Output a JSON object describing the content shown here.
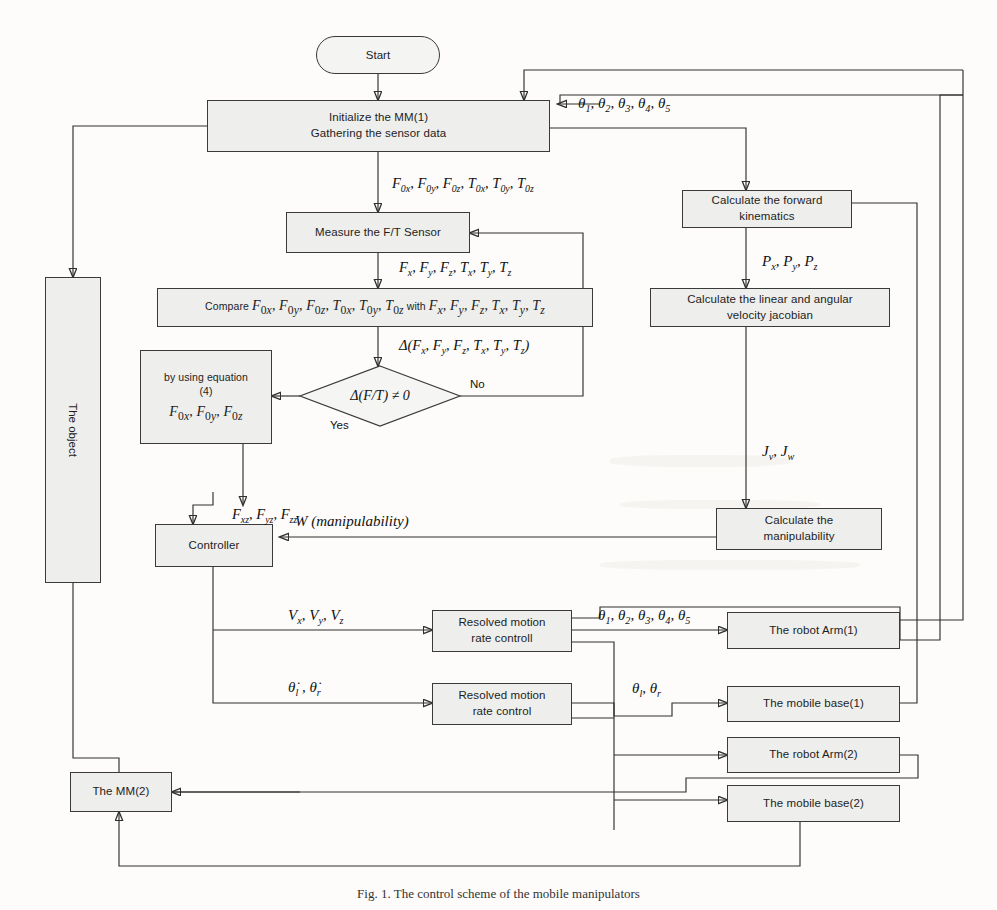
{
  "figure": {
    "caption": "Fig. 1. The control scheme of the mobile manipulators"
  },
  "nodes": {
    "start": {
      "label": "Start",
      "shape": "terminator"
    },
    "initialize": {
      "label": "Initialize the MM(1)\nGathering the sensor data",
      "line1": "Initialize the MM(1)",
      "line2": "Gathering the sensor data",
      "shape": "process"
    },
    "measure_ft": {
      "label": "Measure the F/T Sensor",
      "shape": "process"
    },
    "compare": {
      "label": "Compare F0x , F0y , F0z , T0x , T0y , T0z with  Fx , Fy , Fz , Tx , Ty , Tz",
      "shape": "process"
    },
    "decision": {
      "label": "Δ(F / T) ≠ 0",
      "shape": "decision",
      "yes_label": "Yes",
      "no_label": "No"
    },
    "equation": {
      "line1": "by using equation",
      "line2": "(4)",
      "line3": "F0x , F0y , F0z",
      "shape": "process"
    },
    "controller": {
      "label": "Controller",
      "shape": "process"
    },
    "forward_kinematics": {
      "line1": "Calculate the forward",
      "line2": "kinematics",
      "shape": "process"
    },
    "jacobian": {
      "line1": "Calculate the linear and angular",
      "line2": "velocity jacobian",
      "shape": "process"
    },
    "manipulability": {
      "line1": "Calculate the",
      "line2": "manipulability",
      "shape": "process"
    },
    "rmrc_arm": {
      "line1": "Resolved motion",
      "line2": "rate controll",
      "shape": "process"
    },
    "rmrc_base": {
      "line1": "Resolved motion",
      "line2": "rate control",
      "shape": "process"
    },
    "robot_arm_1": {
      "label": "The robot Arm(1)",
      "shape": "process"
    },
    "mobile_base_1": {
      "label": "The mobile base(1)",
      "shape": "process"
    },
    "robot_arm_2": {
      "label": "The robot Arm(2)",
      "shape": "process"
    },
    "mobile_base_2": {
      "label": "The mobile base(2)",
      "shape": "process"
    },
    "object": {
      "label": "The object",
      "shape": "process-vertical"
    },
    "mm2": {
      "label": "The MM(2)",
      "shape": "process"
    }
  },
  "edge_labels": {
    "theta_feedback_top": "θ1, θ2, θ3, θ4, θ5",
    "f0_t0_vector": "F0x , F0y , F0z , T0x , T0y , T0z",
    "f_t_vector": "Fx , Fy , Fz , Tx , Ty , Tz",
    "delta_vector": "Δ(Fx , Fy , Fz , Tx , Ty , Tz)",
    "position_vector": "Px , Py , Pz",
    "jacobian_vector": "Jv , Jw",
    "forces_xyz": "Fxz , Fyz , Fzz",
    "manipulability": "W (manipulability)",
    "velocity_vector": "Vx , Vy , Vz",
    "theta_dot_lr": "θ̇l , θ̇r",
    "theta_arm": "θ1, θ2, θ3, θ4, θ5",
    "theta_lr": "θl , θr",
    "yes": "Yes",
    "no": "No"
  },
  "colors": {
    "box_fill": "#eeeeec",
    "box_stroke": "#3a3a3a",
    "line": "#2f2f2f",
    "text": "#1d1d1d",
    "page_bg": "#fdfcfa"
  }
}
